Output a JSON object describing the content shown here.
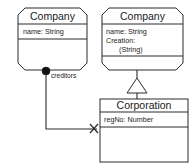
{
  "diagram": {
    "type": "uml-class-diagram",
    "classes": [
      {
        "id": "company-left",
        "name": "Company",
        "shape": "cut-corner-box",
        "compartments": [
          {
            "attributes": [
              "name: String"
            ]
          },
          {
            "attributes": []
          }
        ]
      },
      {
        "id": "company-right",
        "name": "Company",
        "shape": "cut-corner-box",
        "compartments": [
          {
            "attributes": [
              "name: String",
              "Creation:",
              "    (String)"
            ]
          },
          {
            "attributes": []
          }
        ]
      },
      {
        "id": "corporation",
        "name": "Corporation",
        "shape": "rectangle-box",
        "compartments": [
          {
            "attributes": [
              "regNo: Number"
            ]
          },
          {
            "attributes": []
          }
        ]
      }
    ],
    "relations": [
      {
        "id": "creditors-association",
        "kind": "composition",
        "source": "company-left",
        "target": "corporation",
        "role_label": "creditors",
        "source_decoration": "filled-dot",
        "target_decoration": "x-cross",
        "routing": "orthogonal"
      },
      {
        "id": "generalization",
        "kind": "generalization",
        "source": "corporation",
        "target": "company-right",
        "target_decoration": "hollow-triangle"
      }
    ],
    "labels": {
      "company_left_title": "Company",
      "company_left_attr1": "name: String",
      "company_right_title": "Company",
      "company_right_attr1": "name: String",
      "company_right_attr2": "Creation:",
      "company_right_attr3": "(String)",
      "corporation_title": "Corporation",
      "corporation_attr1": "regNo: Number",
      "creditors_role": "creditors"
    },
    "colors": {
      "stroke": "#2b2b2b",
      "fill": "#ffffff",
      "text": "#1b1b1b",
      "dot": "#111111"
    }
  }
}
